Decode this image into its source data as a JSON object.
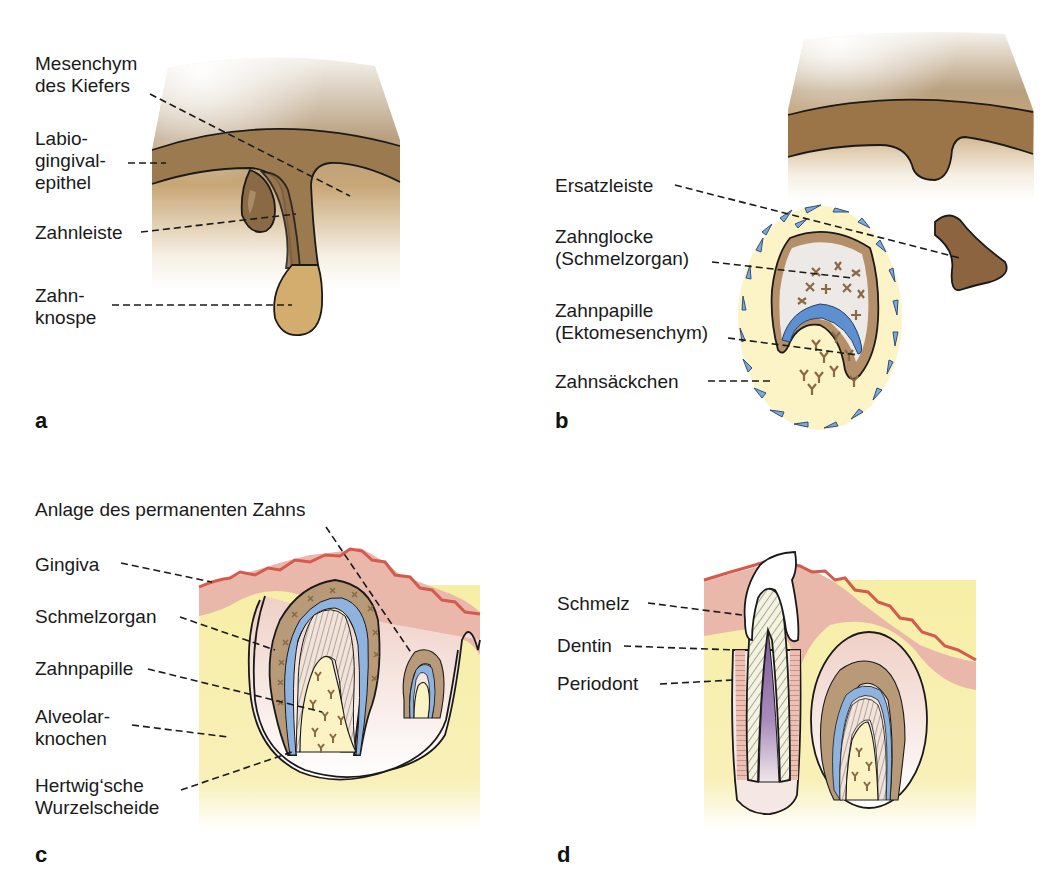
{
  "figure": {
    "colors": {
      "mesenchyme_light": "#f3eee6",
      "mesenchyme_mid": "#c8aa7a",
      "epithelium_brown": "#9b7448",
      "bud_tan": "#d4ae70",
      "sac_yellow": "#fbf3c4",
      "cell_blue": "#7fa9d6",
      "ameloblast_blue": "#5a8ccc",
      "enamel_organ_tan": "#b99a78",
      "gingiva_pink": "#eab8aa",
      "gingiva_red": "#d45a4e",
      "bone_yellow": "#f6eca0",
      "pulp_purple": "#8a6aa6",
      "dentin_stripe": "#f2f2e0"
    }
  },
  "panels": [
    {
      "id": "a",
      "letter": "a",
      "labels": [
        {
          "line1": "Mesenchym",
          "line2": "des Kiefers",
          "line3": ""
        },
        {
          "line1": "Labio-",
          "line2": "gingival-",
          "line3": "epithel"
        },
        {
          "line1": "Zahnleiste",
          "line2": "",
          "line3": ""
        },
        {
          "line1": "Zahn-",
          "line2": "knospe",
          "line3": ""
        }
      ]
    },
    {
      "id": "b",
      "letter": "b",
      "labels": [
        {
          "line1": "Ersatzleiste",
          "line2": ""
        },
        {
          "line1": "Zahnglocke",
          "line2": "(Schmelzorgan)"
        },
        {
          "line1": "Zahnpapille",
          "line2": "(Ektomesenchym)"
        },
        {
          "line1": "Zahnsäckchen",
          "line2": ""
        }
      ]
    },
    {
      "id": "c",
      "letter": "c",
      "labels": [
        {
          "line1": "Anlage des permanenten Zahns",
          "line2": ""
        },
        {
          "line1": "Gingiva",
          "line2": ""
        },
        {
          "line1": "Schmelzorgan",
          "line2": ""
        },
        {
          "line1": "Zahnpapille",
          "line2": ""
        },
        {
          "line1": "Alveolar-",
          "line2": "knochen"
        },
        {
          "line1": "Hertwig‘sche",
          "line2": "Wurzelscheide"
        }
      ]
    },
    {
      "id": "d",
      "letter": "d",
      "labels": [
        {
          "line1": "Schmelz"
        },
        {
          "line1": "Dentin"
        },
        {
          "line1": "Periodont"
        }
      ]
    }
  ]
}
